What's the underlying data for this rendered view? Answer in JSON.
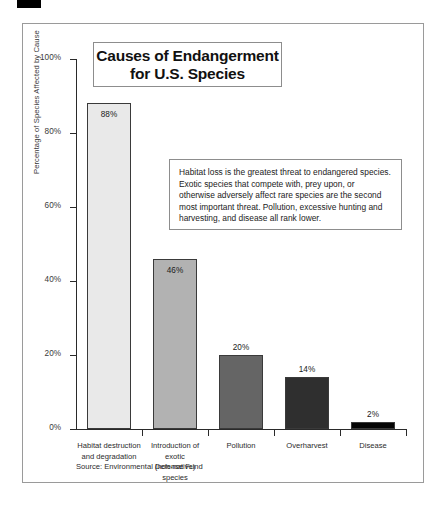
{
  "corner_mark": {
    "name": "black-marker-bar"
  },
  "figure": {
    "title_lines": [
      "Causes of Endangerment",
      "for U.S. Species"
    ],
    "note": "Habitat loss is the greatest threat to endangered species. Exotic species that compete with, prey upon, or otherwise adversely affect rare species are the second most important threat. Pollution, excessive hunting and harvesting, and disease all rank lower.",
    "source": "Source: Environmental Defense Fund"
  },
  "chart_data": {
    "type": "bar",
    "title": "Causes of Endangerment for U.S. Species",
    "xlabel": "",
    "ylabel": "Percentage of Species Affected by Cause",
    "ylim": [
      0,
      100
    ],
    "grid": false,
    "legend": "none",
    "categories": [
      "Habitat destruction and degradation",
      "Introduction of exotic (non-native) species",
      "Pollution",
      "Overharvest",
      "Disease"
    ],
    "category_lines": [
      [
        "Habitat destruction",
        "and degradation"
      ],
      [
        "Introduction of exotic",
        "(non-native) species"
      ],
      [
        "Pollution"
      ],
      [
        "Overharvest"
      ],
      [
        "Disease"
      ]
    ],
    "values": [
      88,
      46,
      20,
      14,
      2
    ],
    "value_labels": [
      "88%",
      "46%",
      "20%",
      "14%",
      "2%"
    ],
    "label_placement": [
      "inside",
      "inside",
      "above",
      "above",
      "above"
    ],
    "bar_colors": [
      "#e9e9e9",
      "#b2b2b2",
      "#656565",
      "#2f2f2f",
      "#050505"
    ],
    "bar_border": "#3a3a3a",
    "ytick_labels": [
      "0%",
      "20%",
      "40%",
      "60%",
      "80%",
      "100%"
    ],
    "ytick_values": [
      0,
      20,
      40,
      60,
      80,
      100
    ]
  }
}
